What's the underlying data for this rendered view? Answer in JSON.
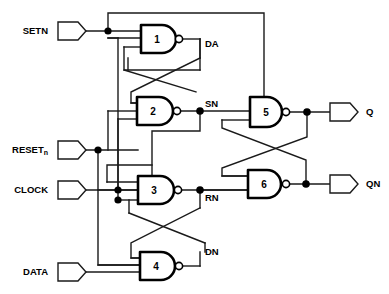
{
  "diagram": {
    "type": "logic-schematic",
    "background_color": "#ffffff",
    "line_color": "#1a1a1a",
    "gate_color": "#000000",
    "width": 389,
    "height": 294
  },
  "inputs": [
    {
      "id": "setn",
      "label": "SETN",
      "sub": "",
      "x": 58,
      "y": 31,
      "label_x": 48,
      "label_y": 31
    },
    {
      "id": "resetn",
      "label": "RESET",
      "sub": "n",
      "x": 58,
      "y": 150,
      "label_x": 48,
      "label_y": 150
    },
    {
      "id": "clock",
      "label": "CLOCK",
      "sub": "",
      "x": 58,
      "y": 190,
      "label_x": 48,
      "label_y": 190
    },
    {
      "id": "data",
      "label": "DATA",
      "sub": "",
      "x": 58,
      "y": 272,
      "label_x": 48,
      "label_y": 272
    }
  ],
  "outputs": [
    {
      "id": "q",
      "label": "Q",
      "x": 330,
      "y": 112,
      "label_x": 368,
      "label_y": 112
    },
    {
      "id": "qn",
      "label": "QN",
      "x": 330,
      "y": 184,
      "label_x": 368,
      "label_y": 184
    }
  ],
  "gates": [
    {
      "id": "g1",
      "number": "1",
      "type": "nand",
      "inputs": 3,
      "x": 140,
      "y": 25,
      "w": 38,
      "h": 28,
      "label": "DA",
      "label_x": 205,
      "label_y": 44
    },
    {
      "id": "g2",
      "number": "2",
      "type": "nand",
      "inputs": 3,
      "x": 137,
      "y": 97,
      "w": 39,
      "h": 28,
      "label": "SN",
      "label_x": 205,
      "label_y": 105
    },
    {
      "id": "g3",
      "number": "3",
      "type": "nand",
      "inputs": 3,
      "x": 138,
      "y": 176,
      "w": 38,
      "h": 28,
      "label": "RN",
      "label_x": 205,
      "label_y": 198
    },
    {
      "id": "g4",
      "number": "4",
      "type": "nand",
      "inputs": 3,
      "x": 140,
      "y": 252,
      "w": 37,
      "h": 28,
      "label": "DN",
      "label_x": 205,
      "label_y": 252
    },
    {
      "id": "g5",
      "number": "5",
      "type": "nand",
      "inputs": 2,
      "x": 250,
      "y": 97,
      "w": 32,
      "h": 30,
      "label": "",
      "label_x": 0,
      "label_y": 0
    },
    {
      "id": "g6",
      "number": "6",
      "type": "nand",
      "inputs": 2,
      "x": 248,
      "y": 170,
      "w": 34,
      "h": 28,
      "label": "",
      "label_x": 0,
      "label_y": 0
    }
  ],
  "net_labels": [
    {
      "id": "da",
      "text": "DA",
      "x": 205,
      "y": 44
    },
    {
      "id": "sn",
      "text": "SN",
      "x": 205,
      "y": 105
    },
    {
      "id": "rn",
      "text": "RN",
      "x": 205,
      "y": 198
    },
    {
      "id": "dn",
      "text": "DN",
      "x": 205,
      "y": 252
    }
  ],
  "junctions": [
    {
      "id": "setn-tap",
      "x": 108,
      "y": 31
    },
    {
      "id": "resetn-tap",
      "x": 98,
      "y": 150
    },
    {
      "id": "clock-tap1",
      "x": 118,
      "y": 190
    },
    {
      "id": "clock-tap2",
      "x": 118,
      "y": 200
    },
    {
      "id": "sn-node",
      "x": 200,
      "y": 111
    },
    {
      "id": "rn-node",
      "x": 200,
      "y": 190
    },
    {
      "id": "q-node",
      "x": 307,
      "y": 112
    },
    {
      "id": "qn-node",
      "x": 306,
      "y": 184
    }
  ],
  "nets": [
    "SETN feeds gate 1 and routes to gate 2 via top rail",
    "RESET_n feeds gate 3 and gate 4",
    "CLOCK feeds gate 2 and gate 3",
    "DATA feeds gate 4",
    "DA (gate 1 out) cross-couples to gate 2",
    "SN (gate 2 out) drives gate 5 and gate 3",
    "RN (gate 3 out) drives gate 6, gate 1 and gate 4",
    "DN (gate 4 out) cross-couples back to gate 3 and gate 1",
    "Gate 5 and gate 6 form the cross-coupled output latch",
    "Q is gate 5 output, QN is gate 6 output"
  ]
}
